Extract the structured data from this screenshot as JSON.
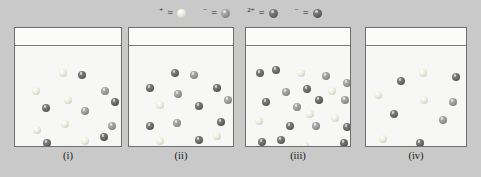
{
  "figure": {
    "title": "",
    "background_color": "#c9c9c9"
  },
  "legend": {
    "entries": [
      {
        "label": "H",
        "charge": "+",
        "equals": "=",
        "species": "H+",
        "icon": "sphere-icon",
        "color": "#efeee2",
        "class": "sp-h"
      },
      {
        "label": "Cl",
        "charge": "−",
        "equals": "=",
        "species": "Cl-",
        "icon": "sphere-icon",
        "color": "#9d9d9d",
        "class": "sp-cl"
      },
      {
        "label": "Ba",
        "charge": "2+",
        "equals": "=",
        "species": "Ba2+",
        "icon": "sphere-icon",
        "color": "#6f6f6f",
        "class": "sp-ba"
      },
      {
        "label": "OH",
        "charge": "−",
        "equals": "=",
        "species": "OH-",
        "icon": "sphere-icon",
        "color": "#6a6a6a",
        "class": "sp-oh"
      }
    ]
  },
  "beakers": [
    {
      "label": "(i)",
      "left": 14,
      "width": 108,
      "height": 120,
      "counts": {
        "H+": 8,
        "Cl-": 4,
        "Ba2+": 0,
        "OH-": 4
      },
      "particles": [
        {
          "species": "H+",
          "class": "sp-h",
          "x": 44,
          "y": 23
        },
        {
          "species": "Ba2+",
          "class": "sp-ba",
          "x": 63,
          "y": 25
        },
        {
          "species": "H+",
          "class": "sp-h",
          "x": 17,
          "y": 41
        },
        {
          "species": "Cl-",
          "class": "sp-cl",
          "x": 86,
          "y": 41
        },
        {
          "species": "H+",
          "class": "sp-h",
          "x": 49,
          "y": 50
        },
        {
          "species": "OH-",
          "class": "sp-oh",
          "x": 96,
          "y": 52
        },
        {
          "species": "Ba2+",
          "class": "sp-ba",
          "x": 27,
          "y": 58
        },
        {
          "species": "Cl-",
          "class": "sp-cl",
          "x": 66,
          "y": 61
        },
        {
          "species": "H+",
          "class": "sp-h",
          "x": 46,
          "y": 74
        },
        {
          "species": "H+",
          "class": "sp-h",
          "x": 18,
          "y": 80
        },
        {
          "species": "Cl-",
          "class": "sp-cl",
          "x": 93,
          "y": 76
        },
        {
          "species": "Ba2+",
          "class": "sp-ba",
          "x": 28,
          "y": 93
        },
        {
          "species": "H+",
          "class": "sp-h",
          "x": 66,
          "y": 91
        },
        {
          "species": "OH-",
          "class": "sp-oh",
          "x": 85,
          "y": 87
        },
        {
          "species": "H+",
          "class": "sp-h",
          "x": 47,
          "y": 102
        }
      ]
    },
    {
      "label": "(ii)",
      "left": 128,
      "width": 106,
      "height": 120,
      "counts": {
        "H+": 4,
        "Cl-": 5,
        "Ba2+": 6,
        "OH-": 2
      },
      "particles": [
        {
          "species": "Ba2+",
          "class": "sp-ba",
          "x": 42,
          "y": 23
        },
        {
          "species": "Cl-",
          "class": "sp-cl",
          "x": 61,
          "y": 25
        },
        {
          "species": "Ba2+",
          "class": "sp-ba",
          "x": 17,
          "y": 38
        },
        {
          "species": "OH-",
          "class": "sp-oh",
          "x": 84,
          "y": 38
        },
        {
          "species": "Cl-",
          "class": "sp-cl",
          "x": 45,
          "y": 44
        },
        {
          "species": "Cl-",
          "class": "sp-cl",
          "x": 95,
          "y": 50
        },
        {
          "species": "H+",
          "class": "sp-h",
          "x": 27,
          "y": 55
        },
        {
          "species": "Ba2+",
          "class": "sp-ba",
          "x": 66,
          "y": 56
        },
        {
          "species": "Ba2+",
          "class": "sp-ba",
          "x": 17,
          "y": 76
        },
        {
          "species": "Cl-",
          "class": "sp-cl",
          "x": 44,
          "y": 73
        },
        {
          "species": "OH-",
          "class": "sp-oh",
          "x": 88,
          "y": 72
        },
        {
          "species": "H+",
          "class": "sp-h",
          "x": 27,
          "y": 91
        },
        {
          "species": "Ba2+",
          "class": "sp-ba",
          "x": 66,
          "y": 90
        },
        {
          "species": "H+",
          "class": "sp-h",
          "x": 84,
          "y": 86
        },
        {
          "species": "Ba2+",
          "class": "sp-ba",
          "x": 45,
          "y": 104
        }
      ]
    },
    {
      "label": "(iii)",
      "left": 245,
      "width": 106,
      "height": 120,
      "counts": {
        "H+": 7,
        "Cl-": 5,
        "Ba2+": 8,
        "OH-": 3
      },
      "particles": [
        {
          "species": "Ba2+",
          "class": "sp-ba",
          "x": 10,
          "y": 23
        },
        {
          "species": "Ba2+",
          "class": "sp-ba",
          "x": 26,
          "y": 20
        },
        {
          "species": "H+",
          "class": "sp-h",
          "x": 51,
          "y": 23
        },
        {
          "species": "Cl-",
          "class": "sp-cl",
          "x": 76,
          "y": 26
        },
        {
          "species": "Cl-",
          "class": "sp-cl",
          "x": 97,
          "y": 33
        },
        {
          "species": "Cl-",
          "class": "sp-cl",
          "x": 36,
          "y": 42
        },
        {
          "species": "Ba2+",
          "class": "sp-ba",
          "x": 57,
          "y": 39
        },
        {
          "species": "H+",
          "class": "sp-h",
          "x": 82,
          "y": 41
        },
        {
          "species": "Ba2+",
          "class": "sp-ba",
          "x": 16,
          "y": 52
        },
        {
          "species": "OH-",
          "class": "sp-oh",
          "x": 69,
          "y": 50
        },
        {
          "species": "Cl-",
          "class": "sp-cl",
          "x": 95,
          "y": 50
        },
        {
          "species": "Cl-",
          "class": "sp-cl",
          "x": 47,
          "y": 57
        },
        {
          "species": "H+",
          "class": "sp-h",
          "x": 9,
          "y": 71
        },
        {
          "species": "H+",
          "class": "sp-h",
          "x": 60,
          "y": 64
        },
        {
          "species": "H+",
          "class": "sp-h",
          "x": 85,
          "y": 68
        },
        {
          "species": "Ba2+",
          "class": "sp-ba",
          "x": 40,
          "y": 76
        },
        {
          "species": "Ba2+",
          "class": "sp-ba",
          "x": 97,
          "y": 77
        },
        {
          "species": "Ba2+",
          "class": "sp-ba",
          "x": 12,
          "y": 92
        },
        {
          "species": "Ba2+",
          "class": "sp-ba",
          "x": 31,
          "y": 90
        },
        {
          "species": "H+",
          "class": "sp-h",
          "x": 55,
          "y": 96
        },
        {
          "species": "OH-",
          "class": "sp-oh",
          "x": 94,
          "y": 93
        },
        {
          "species": "Cl-",
          "class": "sp-cl",
          "x": 66,
          "y": 76
        }
      ]
    },
    {
      "label": "(iv)",
      "left": 365,
      "width": 102,
      "height": 120,
      "counts": {
        "H+": 5,
        "Cl-": 2,
        "Ba2+": 3,
        "OH-": 0
      },
      "particles": [
        {
          "species": "H+",
          "class": "sp-h",
          "x": 53,
          "y": 23
        },
        {
          "species": "Ba2+",
          "class": "sp-ba",
          "x": 31,
          "y": 31
        },
        {
          "species": "Ba2+",
          "class": "sp-ba",
          "x": 86,
          "y": 27
        },
        {
          "species": "H+",
          "class": "sp-h",
          "x": 8,
          "y": 45
        },
        {
          "species": "H+",
          "class": "sp-h",
          "x": 54,
          "y": 50
        },
        {
          "species": "Cl-",
          "class": "sp-cl",
          "x": 83,
          "y": 52
        },
        {
          "species": "Ba2+",
          "class": "sp-ba",
          "x": 24,
          "y": 64
        },
        {
          "species": "Cl-",
          "class": "sp-cl",
          "x": 73,
          "y": 70
        },
        {
          "species": "H+",
          "class": "sp-h",
          "x": 13,
          "y": 89
        },
        {
          "species": "Ba2+",
          "class": "sp-ba",
          "x": 50,
          "y": 93
        }
      ]
    }
  ]
}
